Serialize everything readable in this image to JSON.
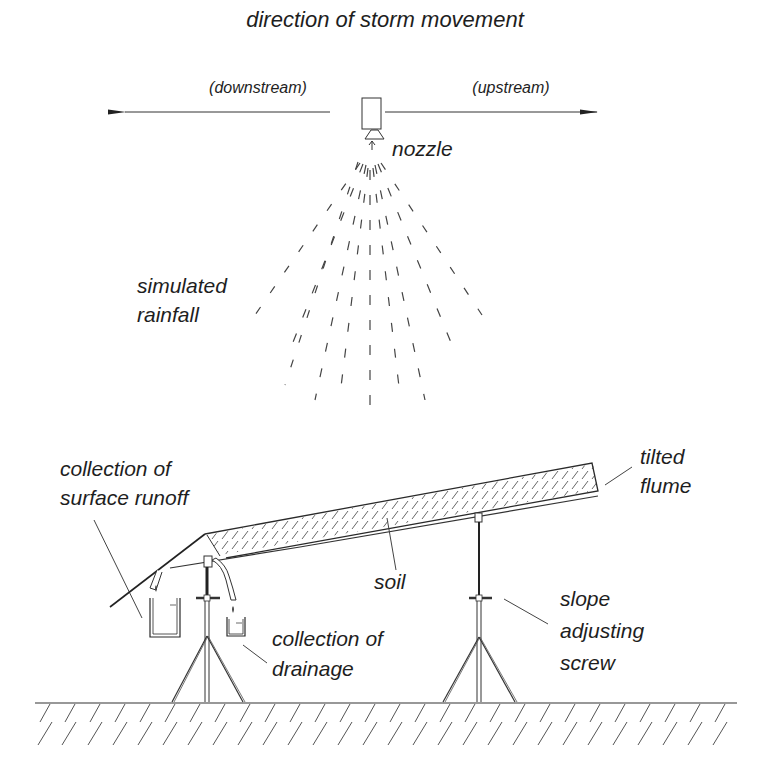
{
  "diagram": {
    "title": "direction of storm movement",
    "direction_labels": {
      "left": "(downstream)",
      "right": "(upstream)"
    },
    "labels": {
      "nozzle": "nozzle",
      "rainfall_line1": "simulated",
      "rainfall_line2": "rainfall",
      "runoff_line1": "collection of",
      "runoff_line2": "surface runoff",
      "flume_line1": "tilted",
      "flume_line2": "flume",
      "soil": "soil",
      "drainage_line1": "collection of",
      "drainage_line2": "drainage",
      "screw_line1": "slope",
      "screw_line2": "adjusting",
      "screw_line3": "screw"
    },
    "components": [
      "arrow-downstream",
      "arrow-upstream",
      "nozzle",
      "simulated-rainfall-spray",
      "tilted-flume",
      "soil-layer",
      "surface-runoff-chute",
      "runoff-collection-container",
      "drainage-pipe",
      "drainage-collection-container",
      "left-tripod-stand",
      "right-tripod-stand",
      "slope-adjusting-screw",
      "ground"
    ],
    "colors": {
      "line": "#2a2a2a",
      "text": "#1e1e1e",
      "background": "#ffffff"
    }
  }
}
